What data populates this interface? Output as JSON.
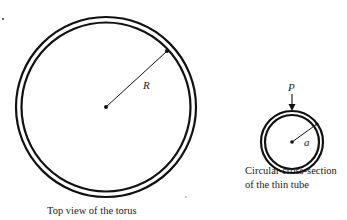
{
  "figure": {
    "torus_top_view": {
      "radius_label": "R",
      "caption": "Top view of the torus"
    },
    "cross_section": {
      "radius_label": "a",
      "force_label": "P",
      "caption_line1": "Circular cross-section",
      "caption_line2": "of the thin tube"
    },
    "colors": {
      "stroke": "#111111",
      "background": "#ffffff"
    }
  }
}
